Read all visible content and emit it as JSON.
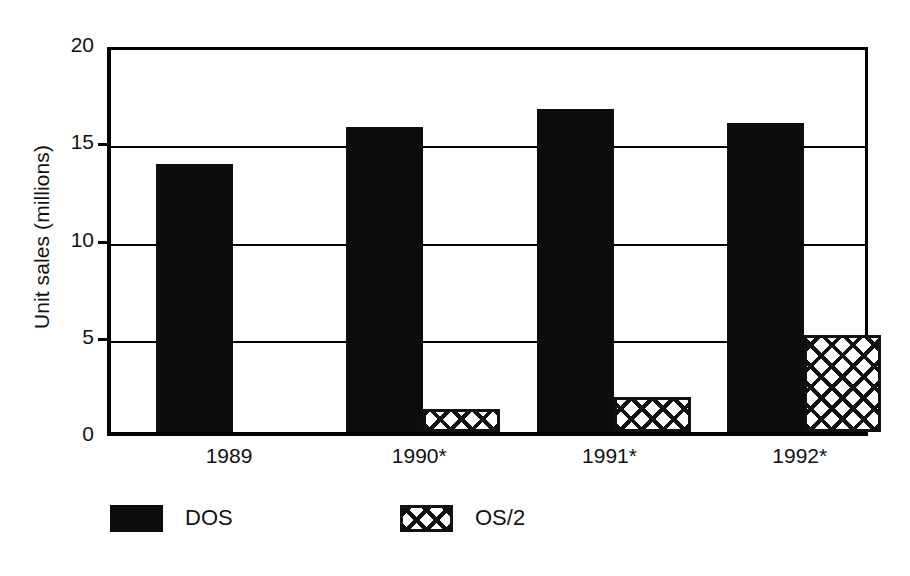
{
  "chart_data": {
    "type": "bar",
    "title": "",
    "xlabel": "",
    "ylabel": "Unit sales (millions)",
    "categories": [
      "1989",
      "1990*",
      "1991*",
      "1992*"
    ],
    "series": [
      {
        "name": "DOS",
        "values": [
          13.8,
          15.7,
          16.6,
          15.9
        ]
      },
      {
        "name": "OS/2",
        "values": [
          0,
          1.2,
          1.8,
          5.0
        ]
      }
    ],
    "ylim": [
      0,
      20
    ],
    "yticks": [
      0,
      5,
      10,
      15,
      20
    ],
    "ytick_labels": [
      "0",
      "5",
      "10",
      "15",
      "20"
    ],
    "grid": true,
    "legend_position": "bottom",
    "colors": {
      "dos": "#0d0d0d",
      "os2_outline": "#111111",
      "os2_fill": "#ffffff",
      "axis": "#000000",
      "background": "#ffffff"
    }
  },
  "legend": {
    "entries": [
      {
        "label": "DOS",
        "swatch": "solid-black-swatch"
      },
      {
        "label": "OS/2",
        "swatch": "crosshatch-swatch"
      }
    ]
  }
}
